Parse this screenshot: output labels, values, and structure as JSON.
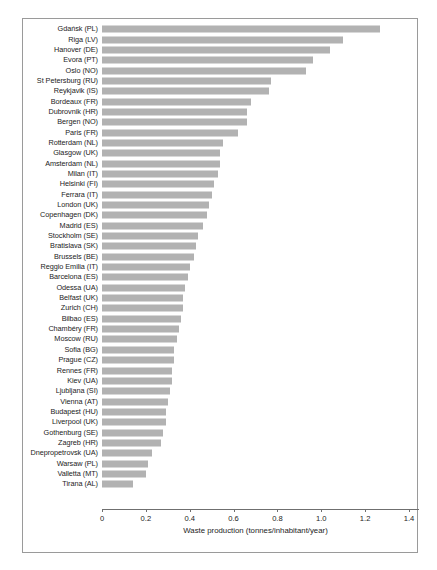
{
  "chart_data": {
    "type": "bar",
    "orientation": "horizontal",
    "title": "",
    "subtitle": "",
    "xlabel": "Waste production (tonnes/inhabitant/year)",
    "ylabel": "",
    "xlim": [
      0,
      1.4
    ],
    "xticks": [
      "0",
      "0.2",
      "0.4",
      "0.6",
      "0.8",
      "1.0",
      "1.2",
      "1.4"
    ],
    "xtick_values": [
      0,
      0.2,
      0.4,
      0.6,
      0.8,
      1.0,
      1.2,
      1.4
    ],
    "grid": false,
    "legend": null,
    "bar_color": "#b2b2b2",
    "frame_color": "#9a9a9a",
    "categories": [
      "Gdańsk (PL)",
      "Riga (LV)",
      "Hanover (DE)",
      "Evora (PT)",
      "Oslo (NO)",
      "St Petersburg (RU)",
      "Reykjavik (IS)",
      "Bordeaux (FR)",
      "Dubrovnik (HR)",
      "Bergen (NO)",
      "Paris (FR)",
      "Rotterdam (NL)",
      "Glasgow (UK)",
      "Amsterdam (NL)",
      "Milan (IT)",
      "Helsinki (FI)",
      "Ferrara (IT)",
      "London (UK)",
      "Copenhagen (DK)",
      "Madrid (ES)",
      "Stockholm (SE)",
      "Bratislava (SK)",
      "Brussels (BE)",
      "Reggio Emilia (IT)",
      "Barcelona (ES)",
      "Odessa (UA)",
      "Belfast (UK)",
      "Zurich (CH)",
      "Bilbao (ES)",
      "Chambéry (FR)",
      "Moscow (RU)",
      "Sofia (BG)",
      "Prague (CZ)",
      "Rennes (FR)",
      "Kiev (UA)",
      "Ljubljana (SI)",
      "Vienna (AT)",
      "Budapest (HU)",
      "Liverpool (UK)",
      "Gothenburg (SE)",
      "Zagreb (HR)",
      "Dnepropetrovsk (UA)",
      "Warsaw (PL)",
      "Valletta (MT)",
      "Tirana (AL)"
    ],
    "values": [
      1.27,
      1.1,
      1.04,
      0.96,
      0.93,
      0.77,
      0.76,
      0.68,
      0.66,
      0.66,
      0.62,
      0.55,
      0.54,
      0.54,
      0.53,
      0.51,
      0.5,
      0.49,
      0.48,
      0.46,
      0.44,
      0.43,
      0.42,
      0.4,
      0.39,
      0.38,
      0.37,
      0.37,
      0.36,
      0.35,
      0.34,
      0.33,
      0.33,
      0.32,
      0.32,
      0.31,
      0.3,
      0.29,
      0.29,
      0.28,
      0.27,
      0.23,
      0.21,
      0.2,
      0.14
    ]
  }
}
